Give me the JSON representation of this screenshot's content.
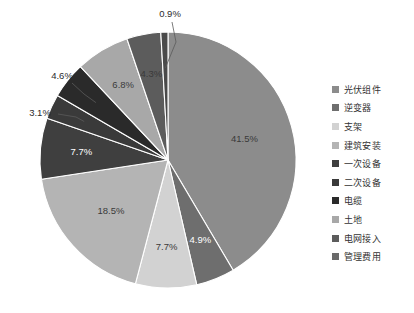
{
  "chart_data": {
    "type": "pie",
    "title": "",
    "subtitle": "",
    "xlabel": "",
    "ylabel": "",
    "grid": false,
    "legend_position": "right",
    "start_angle_deg": 0,
    "direction": "clockwise",
    "background": "#ffffff",
    "categories": [
      "光伏组件",
      "逆变器",
      "支架",
      "建筑安装",
      "一次设备",
      "二次设备",
      "电缆",
      "土地",
      "电网接入",
      "管理费用"
    ],
    "values": [
      41.5,
      4.9,
      7.7,
      18.5,
      7.7,
      3.1,
      4.6,
      6.8,
      4.3,
      0.9
    ],
    "labels": [
      "41.5%",
      "4.9%",
      "7.7%",
      "18.5%",
      "7.7%",
      "3.1%",
      "4.6%",
      "6.8%",
      "4.3%",
      "0.9%"
    ],
    "colors": [
      "#8c8c8c",
      "#6e6e6e",
      "#d2d2d2",
      "#b4b4b4",
      "#3f3f3f",
      "#3a3a3a",
      "#2a2a2a",
      "#a8a8a8",
      "#5c5c5c",
      "#4a4a4a"
    ],
    "label_placement": [
      "inside",
      "inside",
      "inside",
      "inside",
      "inside",
      "outside",
      "outside",
      "inside",
      "inside",
      "outside"
    ],
    "label_text_colors": [
      "#3a3a3a",
      "#ffffff",
      "#3a3a3a",
      "#3a3a3a",
      "#ffffff",
      "#2b2b2b",
      "#2b2b2b",
      "#3a3a3a",
      "#3a3a3a",
      "#2b2b2b"
    ]
  },
  "geometry": {
    "center_x": 168,
    "center_y": 160,
    "radius": 128
  },
  "legend": {
    "items": [
      {
        "label": "光伏组件",
        "color": "#8c8c8c"
      },
      {
        "label": "逆变器",
        "color": "#6e6e6e"
      },
      {
        "label": "支架",
        "color": "#d2d2d2"
      },
      {
        "label": "建筑安装",
        "color": "#b4b4b4"
      },
      {
        "label": "一次设备",
        "color": "#3f3f3f"
      },
      {
        "label": "二次设备",
        "color": "#3a3a3a"
      },
      {
        "label": "电缆",
        "color": "#2a2a2a"
      },
      {
        "label": "土地",
        "color": "#a8a8a8"
      },
      {
        "label": "电网接入",
        "color": "#5c5c5c"
      },
      {
        "label": "管理费用",
        "color": "#6a6a6a"
      }
    ]
  }
}
